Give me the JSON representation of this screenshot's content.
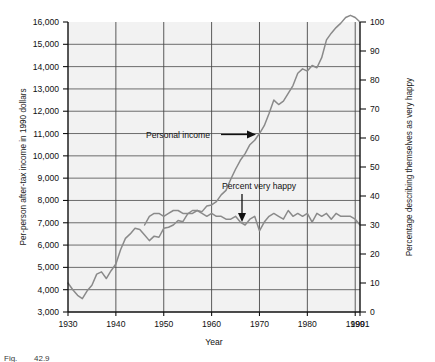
{
  "figure": {
    "caption_prefix": "Fig.",
    "caption_number": "42.9"
  },
  "chart_data": {
    "type": "line",
    "title": "",
    "xlabel": "Year",
    "grid": true,
    "legend_position": "inline-annotations",
    "xlim": [
      1930,
      1991
    ],
    "x_ticks": [
      1930,
      1940,
      1950,
      1960,
      1970,
      1980,
      1990,
      1991
    ],
    "x_tick_labels": [
      "1930",
      "1940",
      "1950",
      "1960",
      "1970",
      "1980",
      "1990",
      "1991"
    ],
    "left_axis": {
      "label": "Per-person after-tax income in 1990 dollars",
      "ylim": [
        3000,
        16000
      ],
      "ticks": [
        3000,
        4000,
        5000,
        6000,
        7000,
        8000,
        9000,
        10000,
        11000,
        12000,
        13000,
        14000,
        15000,
        16000
      ],
      "tick_labels": [
        "3,000",
        "4,000",
        "5,000",
        "6,000",
        "7,000",
        "8,000",
        "9,000",
        "10,000",
        "11,000",
        "12,000",
        "13,000",
        "14,000",
        "15,000",
        "16,000"
      ]
    },
    "right_axis": {
      "label": "Percentage describing themselves as very happy",
      "ylim": [
        0,
        100
      ],
      "ticks": [
        0,
        10,
        20,
        30,
        40,
        50,
        60,
        70,
        80,
        90,
        100
      ],
      "tick_labels": [
        "0",
        "10",
        "20",
        "30",
        "40",
        "50",
        "60",
        "70",
        "80",
        "90",
        "100"
      ]
    },
    "series": [
      {
        "name": "Personal income",
        "axis": "left",
        "color": "#8a8a8a",
        "annotation": "Personal income",
        "x": [
          1930,
          1931,
          1932,
          1933,
          1934,
          1935,
          1936,
          1937,
          1938,
          1939,
          1940,
          1941,
          1942,
          1943,
          1944,
          1945,
          1946,
          1947,
          1948,
          1949,
          1950,
          1951,
          1952,
          1953,
          1954,
          1955,
          1956,
          1957,
          1958,
          1959,
          1960,
          1961,
          1962,
          1963,
          1964,
          1965,
          1966,
          1967,
          1968,
          1969,
          1970,
          1971,
          1972,
          1973,
          1974,
          1975,
          1976,
          1977,
          1978,
          1979,
          1980,
          1981,
          1982,
          1983,
          1984,
          1985,
          1986,
          1987,
          1988,
          1989,
          1990,
          1991
        ],
        "y": [
          4300,
          4000,
          3750,
          3600,
          3950,
          4200,
          4700,
          4800,
          4500,
          4850,
          5150,
          5800,
          6300,
          6500,
          6750,
          6700,
          6450,
          6200,
          6400,
          6350,
          6750,
          6800,
          6900,
          7100,
          7050,
          7400,
          7550,
          7550,
          7500,
          7750,
          7800,
          7950,
          8250,
          8450,
          8950,
          9400,
          9800,
          10100,
          10500,
          10700,
          11000,
          11350,
          11900,
          12500,
          12300,
          12450,
          12800,
          13150,
          13700,
          13900,
          13800,
          14050,
          13950,
          14400,
          15200,
          15500,
          15750,
          15950,
          16200,
          16300,
          16200,
          16000
        ]
      },
      {
        "name": "Percent very happy",
        "axis": "right",
        "color": "#8a8a8a",
        "annotation": "Percent very happy",
        "x": [
          1946,
          1947,
          1948,
          1949,
          1950,
          1951,
          1952,
          1953,
          1954,
          1955,
          1956,
          1957,
          1958,
          1959,
          1960,
          1961,
          1962,
          1963,
          1964,
          1965,
          1966,
          1967,
          1968,
          1969,
          1970,
          1971,
          1972,
          1973,
          1974,
          1975,
          1976,
          1977,
          1978,
          1979,
          1980,
          1981,
          1982,
          1983,
          1984,
          1985,
          1986,
          1987,
          1988,
          1989,
          1990,
          1991
        ],
        "y": [
          30,
          33,
          34,
          34,
          33,
          34,
          35,
          35,
          34,
          34,
          34,
          35,
          34,
          33,
          34,
          33,
          33,
          32,
          32,
          33,
          31,
          30,
          32,
          33,
          28,
          31,
          33,
          34,
          33,
          32,
          35,
          33,
          34,
          33,
          34,
          31,
          34,
          33,
          34,
          32,
          34,
          33,
          33,
          33,
          32,
          30
        ]
      }
    ],
    "annotations": [
      {
        "text": "Personal income",
        "with_arrow": true,
        "arrow_direction": "right"
      },
      {
        "text": "Percent very happy",
        "with_arrow": true,
        "arrow_direction": "down"
      }
    ]
  }
}
